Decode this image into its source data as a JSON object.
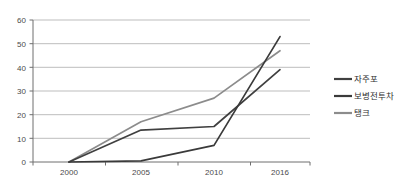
{
  "chart_data": {
    "type": "line",
    "title": "",
    "title_note": "title cropped at top edge of screenshot",
    "xlabel": "",
    "ylabel": "",
    "categories": [
      "2000",
      "2005",
      "2010",
      "2016"
    ],
    "ylim": [
      0,
      60
    ],
    "yticks": [
      0,
      10,
      20,
      30,
      40,
      50,
      60
    ],
    "grid": true,
    "legend_position": "right",
    "series": [
      {
        "name": "자주포",
        "values": [
          0,
          13.5,
          15,
          39
        ],
        "color": "#404040"
      },
      {
        "name": "보병전투차",
        "values": [
          0,
          0.5,
          7,
          53
        ],
        "color": "#3a3a3a"
      },
      {
        "name": "탱크",
        "values": [
          0,
          17,
          27,
          47
        ],
        "color": "#8c8c8c"
      }
    ]
  },
  "axis": {
    "y_tick_0": "0",
    "y_tick_1": "10",
    "y_tick_2": "20",
    "y_tick_3": "30",
    "y_tick_4": "40",
    "y_tick_5": "50",
    "y_tick_6": "60",
    "x_tick_0": "2000",
    "x_tick_1": "2005",
    "x_tick_2": "2010",
    "x_tick_3": "2016"
  },
  "legend": {
    "item_0": "자주포",
    "item_1": "보병전투차",
    "item_2": "탱크"
  },
  "colors": {
    "series_1": "#404040",
    "series_2": "#3a3a3a",
    "series_3": "#8c8c8c",
    "gridline": "#b5b5b5",
    "axis": "#6e6e6e",
    "background": "#ffffff"
  }
}
